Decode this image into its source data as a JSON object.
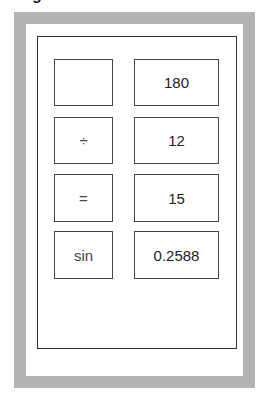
{
  "clipped_header_glyph": "g",
  "frame": {
    "outer_color": "#b3b3b3",
    "inner_border_color": "#333333"
  },
  "rows": [
    {
      "operator": "",
      "value": "180"
    },
    {
      "operator": "÷",
      "value": "12"
    },
    {
      "operator": "=",
      "value": "15"
    },
    {
      "operator": "sin",
      "value": "0.2588"
    }
  ]
}
